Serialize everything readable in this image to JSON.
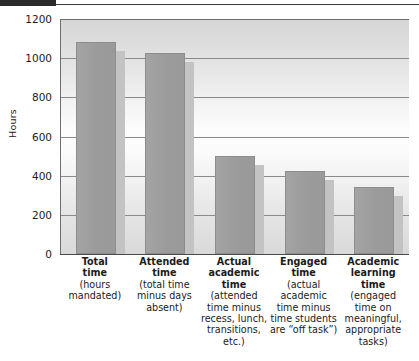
{
  "chart_data": {
    "type": "bar",
    "title": "",
    "xlabel": "",
    "ylabel": "Hours",
    "ylim": [
      0,
      1200
    ],
    "yticks": [
      0,
      200,
      400,
      600,
      800,
      1000,
      1200
    ],
    "ytick_labels": [
      "0",
      "200",
      "400",
      "600",
      "800",
      "1000",
      "1200"
    ],
    "grid": true,
    "legend": null,
    "categories": [
      "Total time (hours mandated)",
      "Attended time (total time minus days absent)",
      "Actual academic time (attended time minus recess, lunch, transitions, etc.)",
      "Engaged time (actual academic time minus time students are “off task”)",
      "Academic learning time (engaged time on meaningful, appropriate tasks)"
    ],
    "values": [
      1080,
      1025,
      500,
      425,
      340
    ],
    "bar_color": "#9b9b9b",
    "shadow_color": "#c3c3c3",
    "grid_color": "#8a8a8a",
    "axis_color": "#4a4a4a"
  },
  "axis": {
    "y_title": "Hours",
    "y_ticks": [
      {
        "value": 1200,
        "label": "1200"
      },
      {
        "value": 1000,
        "label": "1000"
      },
      {
        "value": 800,
        "label": "800"
      },
      {
        "value": 600,
        "label": "600"
      },
      {
        "value": 400,
        "label": "400"
      },
      {
        "value": 200,
        "label": "200"
      },
      {
        "value": 0,
        "label": "0"
      }
    ]
  },
  "categories": [
    {
      "id": "total-time",
      "heading": [
        "Total",
        "time"
      ],
      "detail": [
        "(hours",
        "mandated)"
      ],
      "value": 1080
    },
    {
      "id": "attended-time",
      "heading": [
        "Attended",
        "time"
      ],
      "detail": [
        "(total time",
        "minus days",
        "absent)"
      ],
      "value": 1025
    },
    {
      "id": "actual-academic-time",
      "heading": [
        "Actual",
        "academic",
        "time"
      ],
      "detail": [
        "(attended",
        "time minus",
        "recess, lunch,",
        "transitions,",
        "etc.)"
      ],
      "value": 500
    },
    {
      "id": "engaged-time",
      "heading": [
        "Engaged",
        "time"
      ],
      "detail": [
        "(actual",
        "academic",
        "time minus",
        "time students",
        "are “off task”)"
      ],
      "value": 425
    },
    {
      "id": "academic-learning-time",
      "heading": [
        "Academic",
        "learning",
        "time"
      ],
      "detail": [
        "(engaged",
        "time on",
        "meaningful,",
        "appropriate",
        "tasks)"
      ],
      "value": 340
    }
  ]
}
